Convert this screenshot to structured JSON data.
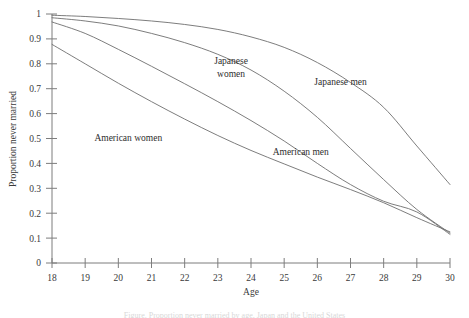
{
  "figure": {
    "axis_title_x": "Age",
    "axis_title_y": "Proportion never married",
    "clipped_caption": "Figure. Proportion never married by age, Japan and the United States"
  },
  "chart_data": {
    "type": "line",
    "title": "",
    "xlabel": "Age",
    "ylabel": "Proportion never married",
    "xlim": [
      18,
      30
    ],
    "ylim": [
      0,
      1
    ],
    "grid": false,
    "legend": "inline-labels",
    "xticks": [
      "18",
      "19",
      "20",
      "21",
      "22",
      "23",
      "24",
      "25",
      "26",
      "27",
      "28",
      "29",
      "30"
    ],
    "yticks": [
      "0",
      "0.1",
      "0.2",
      "0.3",
      "0.4",
      "0.5",
      "0.6",
      "0.7",
      "0.8",
      "0.9",
      "1"
    ],
    "x": [
      18,
      19,
      20,
      21,
      22,
      23,
      24,
      25,
      26,
      27,
      28,
      29,
      30
    ],
    "series": [
      {
        "name": "Japanese men",
        "label": "Japanese men",
        "label_x": 26.7,
        "label_y": 0.715,
        "values": [
          0.995,
          0.99,
          0.982,
          0.972,
          0.958,
          0.938,
          0.908,
          0.866,
          0.805,
          0.725,
          0.625,
          0.47,
          0.315
        ]
      },
      {
        "name": "Japanese women",
        "label": "Japanese women",
        "label_x": 23.4,
        "label_y": 0.8,
        "values": [
          0.985,
          0.972,
          0.952,
          0.922,
          0.885,
          0.838,
          0.775,
          0.69,
          0.585,
          0.46,
          0.335,
          0.215,
          0.12
        ]
      },
      {
        "name": "American men",
        "label": "American men",
        "label_x": 25.5,
        "label_y": 0.435,
        "values": [
          0.968,
          0.922,
          0.858,
          0.79,
          0.72,
          0.648,
          0.572,
          0.49,
          0.4,
          0.315,
          0.248,
          0.205,
          0.115
        ]
      },
      {
        "name": "American women",
        "label": "American women",
        "label_x": 20.3,
        "label_y": 0.488,
        "values": [
          0.878,
          0.8,
          0.722,
          0.648,
          0.578,
          0.512,
          0.452,
          0.398,
          0.345,
          0.295,
          0.242,
          0.182,
          0.125
        ]
      }
    ]
  }
}
